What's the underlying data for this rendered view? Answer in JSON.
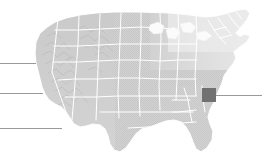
{
  "figure": {
    "type": "locator-map",
    "region": "United States",
    "background_color": "#ffffff",
    "map_fill_color": "#cfcfcf",
    "map_border_color": "#ffffff",
    "highlight_color": "#717171",
    "leader_line_color": "#9a9a9a",
    "width": 269,
    "height": 162
  },
  "highlight": {
    "label": "Georgia",
    "shape": "square",
    "x": 202,
    "y": 88,
    "width": 14,
    "height": 14,
    "color": "#717171"
  },
  "leader_lines": [
    {
      "name": "leader-line-left-top",
      "x": 0,
      "y": 63,
      "length": 36,
      "color": "#9a9a9a"
    },
    {
      "name": "leader-line-left-middle",
      "x": 0,
      "y": 93,
      "length": 43,
      "color": "#9a9a9a"
    },
    {
      "name": "leader-line-left-bottom",
      "x": 0,
      "y": 128,
      "length": 62,
      "color": "#9a9a9a"
    },
    {
      "name": "leader-line-right",
      "x": 216,
      "y": 95,
      "length": 46,
      "color": "#9a9a9a"
    }
  ],
  "map_regions": [
    {
      "name": "west-coast",
      "shading": "mountainous",
      "tone": "#c4c4c4"
    },
    {
      "name": "great-plains",
      "shading": "flat",
      "tone": "#d4d4d4"
    },
    {
      "name": "great-lakes",
      "shading": "faded",
      "tone": "#e8e8e8"
    },
    {
      "name": "northeast",
      "shading": "faded",
      "tone": "#ececec"
    },
    {
      "name": "southeast",
      "shading": "flat",
      "tone": "#d2d2d2"
    },
    {
      "name": "florida",
      "shading": "flat",
      "tone": "#d6d6d6"
    },
    {
      "name": "texas",
      "shading": "flat",
      "tone": "#d2d2d2"
    }
  ],
  "annotations": {
    "has_text_labels": false,
    "has_axis": false,
    "has_legend": false
  }
}
